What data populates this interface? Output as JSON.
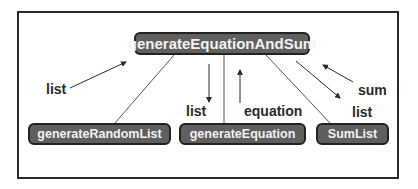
{
  "diagram": {
    "type": "call-tree",
    "root": {
      "label": "generateEquationAndSum"
    },
    "children": [
      {
        "label": "generateRandomList"
      },
      {
        "label": "generateEquation"
      },
      {
        "label": "SumList"
      }
    ],
    "edge_labels": {
      "random_list_return": "list",
      "equation_arg": "list",
      "equation_return": "equation",
      "sum_return": "sum",
      "sum_arg": "list"
    },
    "colors": {
      "node_fill": "#5f5f5f",
      "node_text": "#f2f2f2",
      "line": "#2a2a2a"
    }
  }
}
